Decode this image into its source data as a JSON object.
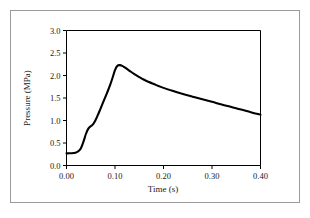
{
  "figure": {
    "background_color": "#ffffff",
    "border_color": "#9a9a9a",
    "curve_color": "#000000",
    "axis_color": "#000000"
  },
  "chart_data": {
    "type": "line",
    "title": "",
    "subtitle": "",
    "xlabel": "Time (s)",
    "ylabel": "Pressure (MPa)",
    "xlim": [
      0.0,
      0.4
    ],
    "ylim": [
      0.0,
      3.0
    ],
    "xticks": [
      0.0,
      0.1,
      0.2,
      0.3,
      0.4
    ],
    "yticks": [
      0.0,
      0.5,
      1.0,
      1.5,
      2.0,
      2.5,
      3.0
    ],
    "xtick_labels": [
      "0.00",
      "0.10",
      "0.20",
      "0.30",
      "0.40"
    ],
    "ytick_labels": [
      "0.0",
      "0.5",
      "1.0",
      "1.5",
      "2.0",
      "2.5",
      "3.0"
    ],
    "grid": false,
    "legend": null,
    "legend_position": "none",
    "annotations": [],
    "series": [
      {
        "name": "Pressure",
        "color": "#000000",
        "x": [
          0.0,
          0.005,
          0.01,
          0.015,
          0.02,
          0.025,
          0.03,
          0.035,
          0.04,
          0.045,
          0.05,
          0.055,
          0.06,
          0.065,
          0.07,
          0.075,
          0.08,
          0.085,
          0.09,
          0.095,
          0.1,
          0.105,
          0.11,
          0.115,
          0.12,
          0.13,
          0.14,
          0.15,
          0.16,
          0.17,
          0.18,
          0.19,
          0.2,
          0.22,
          0.24,
          0.26,
          0.28,
          0.3,
          0.32,
          0.34,
          0.36,
          0.38,
          0.4
        ],
        "y": [
          0.27,
          0.271,
          0.273,
          0.278,
          0.29,
          0.32,
          0.39,
          0.53,
          0.7,
          0.82,
          0.87,
          0.92,
          1.01,
          1.13,
          1.26,
          1.39,
          1.52,
          1.65,
          1.79,
          1.95,
          2.12,
          2.215,
          2.23,
          2.215,
          2.18,
          2.105,
          2.03,
          1.965,
          1.905,
          1.855,
          1.81,
          1.765,
          1.725,
          1.655,
          1.59,
          1.53,
          1.47,
          1.415,
          1.355,
          1.3,
          1.245,
          1.185,
          1.13
        ]
      }
    ]
  },
  "axes": {
    "x_title": "Time (s)",
    "y_title": "Pressure (MPa)"
  }
}
